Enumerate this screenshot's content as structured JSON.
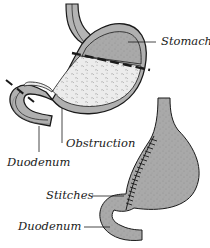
{
  "diagram": {
    "type": "medical-illustration",
    "panels": [
      {
        "id": "before",
        "description": "Stomach with gastric outlet obstruction showing resection lines"
      },
      {
        "id": "after",
        "description": "Reconstructed stomach stitched to duodenum"
      }
    ]
  },
  "labels": {
    "stomach": "Stomach",
    "obstruction": "Obstruction",
    "duodenum_top": "Duodenum",
    "stitches": "Stitches",
    "duodenum_bottom": "Duodenum"
  },
  "colors": {
    "tissue_gray": "#a8a8a8",
    "tissue_light": "#e8e8e8",
    "outline": "#1a1a1a",
    "background": "#ffffff"
  }
}
